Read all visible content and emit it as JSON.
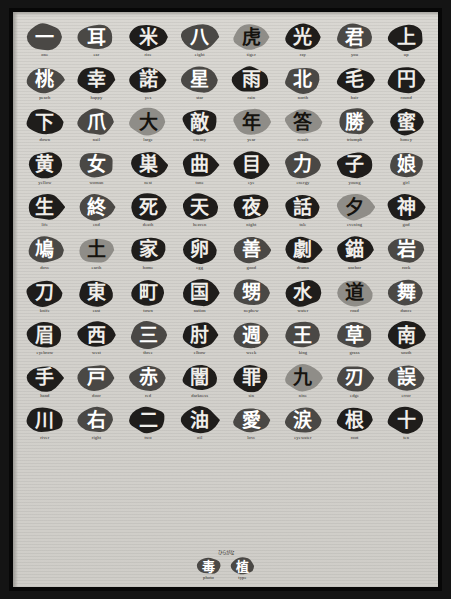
{
  "poster": {
    "title": "Kanji character stamp poster",
    "background_color": "#d5d3ce",
    "frame_color": "#070707",
    "ink_dark": "#1f1d1b",
    "ink_mid": "#4a4845",
    "ink_light": "#8f8d88"
  },
  "colophon": {
    "top_text": "ひらがな",
    "items": [
      {
        "glyph": "毒",
        "label": "photo",
        "tone": "mid"
      },
      {
        "glyph": "植",
        "label": "type",
        "tone": "mid"
      }
    ]
  },
  "grid": {
    "columns": 8,
    "rows": 10,
    "cells": [
      {
        "glyph": "一",
        "label": "one",
        "tone": "mid"
      },
      {
        "glyph": "耳",
        "label": "ear",
        "tone": "mid"
      },
      {
        "glyph": "米",
        "label": "rice",
        "tone": "dark"
      },
      {
        "glyph": "八",
        "label": "eight",
        "tone": "mid"
      },
      {
        "glyph": "虎",
        "label": "tiger",
        "tone": "light"
      },
      {
        "glyph": "光",
        "label": "ray",
        "tone": "dark"
      },
      {
        "glyph": "君",
        "label": "you",
        "tone": "mid"
      },
      {
        "glyph": "上",
        "label": "up",
        "tone": "dark"
      },
      {
        "glyph": "桃",
        "label": "peach",
        "tone": "mid"
      },
      {
        "glyph": "幸",
        "label": "happy",
        "tone": "dark"
      },
      {
        "glyph": "諾",
        "label": "yes",
        "tone": "dark"
      },
      {
        "glyph": "星",
        "label": "star",
        "tone": "mid"
      },
      {
        "glyph": "雨",
        "label": "rain",
        "tone": "dark"
      },
      {
        "glyph": "北",
        "label": "north",
        "tone": "mid"
      },
      {
        "glyph": "毛",
        "label": "hair",
        "tone": "dark"
      },
      {
        "glyph": "円",
        "label": "round",
        "tone": "dark"
      },
      {
        "glyph": "下",
        "label": "down",
        "tone": "dark"
      },
      {
        "glyph": "爪",
        "label": "nail",
        "tone": "mid"
      },
      {
        "glyph": "大",
        "label": "large",
        "tone": "light"
      },
      {
        "glyph": "敵",
        "label": "enemy",
        "tone": "dark"
      },
      {
        "glyph": "年",
        "label": "year",
        "tone": "light"
      },
      {
        "glyph": "答",
        "label": "result",
        "tone": "light"
      },
      {
        "glyph": "勝",
        "label": "triumph",
        "tone": "mid"
      },
      {
        "glyph": "蜜",
        "label": "honey",
        "tone": "dark"
      },
      {
        "glyph": "黄",
        "label": "yellow",
        "tone": "dark"
      },
      {
        "glyph": "女",
        "label": "woman",
        "tone": "mid"
      },
      {
        "glyph": "巣",
        "label": "nest",
        "tone": "dark"
      },
      {
        "glyph": "曲",
        "label": "tune",
        "tone": "dark"
      },
      {
        "glyph": "目",
        "label": "eye",
        "tone": "dark"
      },
      {
        "glyph": "力",
        "label": "energy",
        "tone": "mid"
      },
      {
        "glyph": "子",
        "label": "young",
        "tone": "dark"
      },
      {
        "glyph": "娘",
        "label": "girl",
        "tone": "mid"
      },
      {
        "glyph": "生",
        "label": "life",
        "tone": "dark"
      },
      {
        "glyph": "終",
        "label": "end",
        "tone": "mid"
      },
      {
        "glyph": "死",
        "label": "death",
        "tone": "dark"
      },
      {
        "glyph": "天",
        "label": "heaven",
        "tone": "dark"
      },
      {
        "glyph": "夜",
        "label": "night",
        "tone": "dark"
      },
      {
        "glyph": "話",
        "label": "tale",
        "tone": "dark"
      },
      {
        "glyph": "夕",
        "label": "evening",
        "tone": "light"
      },
      {
        "glyph": "神",
        "label": "god",
        "tone": "dark"
      },
      {
        "glyph": "鳩",
        "label": "dove",
        "tone": "mid"
      },
      {
        "glyph": "土",
        "label": "earth",
        "tone": "light"
      },
      {
        "glyph": "家",
        "label": "home",
        "tone": "dark"
      },
      {
        "glyph": "卵",
        "label": "egg",
        "tone": "dark"
      },
      {
        "glyph": "善",
        "label": "good",
        "tone": "mid"
      },
      {
        "glyph": "劇",
        "label": "drama",
        "tone": "dark"
      },
      {
        "glyph": "錨",
        "label": "anchor",
        "tone": "dark"
      },
      {
        "glyph": "岩",
        "label": "rock",
        "tone": "mid"
      },
      {
        "glyph": "刀",
        "label": "knife",
        "tone": "dark"
      },
      {
        "glyph": "東",
        "label": "east",
        "tone": "dark"
      },
      {
        "glyph": "町",
        "label": "town",
        "tone": "dark"
      },
      {
        "glyph": "国",
        "label": "nation",
        "tone": "dark"
      },
      {
        "glyph": "甥",
        "label": "nephew",
        "tone": "mid"
      },
      {
        "glyph": "水",
        "label": "water",
        "tone": "dark"
      },
      {
        "glyph": "道",
        "label": "road",
        "tone": "light"
      },
      {
        "glyph": "舞",
        "label": "dance",
        "tone": "mid"
      },
      {
        "glyph": "眉",
        "label": "eyebrow",
        "tone": "dark"
      },
      {
        "glyph": "西",
        "label": "west",
        "tone": "dark"
      },
      {
        "glyph": "三",
        "label": "three",
        "tone": "mid"
      },
      {
        "glyph": "肘",
        "label": "elbow",
        "tone": "dark"
      },
      {
        "glyph": "週",
        "label": "week",
        "tone": "mid"
      },
      {
        "glyph": "王",
        "label": "king",
        "tone": "mid"
      },
      {
        "glyph": "草",
        "label": "grass",
        "tone": "mid"
      },
      {
        "glyph": "南",
        "label": "south",
        "tone": "dark"
      },
      {
        "glyph": "手",
        "label": "hand",
        "tone": "dark"
      },
      {
        "glyph": "戸",
        "label": "door",
        "tone": "mid"
      },
      {
        "glyph": "赤",
        "label": "red",
        "tone": "mid"
      },
      {
        "glyph": "闇",
        "label": "darkness",
        "tone": "dark"
      },
      {
        "glyph": "罪",
        "label": "sin",
        "tone": "dark"
      },
      {
        "glyph": "九",
        "label": "nine",
        "tone": "light"
      },
      {
        "glyph": "刃",
        "label": "edge",
        "tone": "mid"
      },
      {
        "glyph": "誤",
        "label": "error",
        "tone": "mid"
      },
      {
        "glyph": "川",
        "label": "river",
        "tone": "dark"
      },
      {
        "glyph": "右",
        "label": "right",
        "tone": "mid"
      },
      {
        "glyph": "二",
        "label": "two",
        "tone": "dark"
      },
      {
        "glyph": "油",
        "label": "oil",
        "tone": "dark"
      },
      {
        "glyph": "愛",
        "label": "love",
        "tone": "mid"
      },
      {
        "glyph": "涙",
        "label": "eyewater",
        "tone": "mid"
      },
      {
        "glyph": "根",
        "label": "root",
        "tone": "dark"
      },
      {
        "glyph": "十",
        "label": "ten",
        "tone": "dark"
      }
    ]
  }
}
